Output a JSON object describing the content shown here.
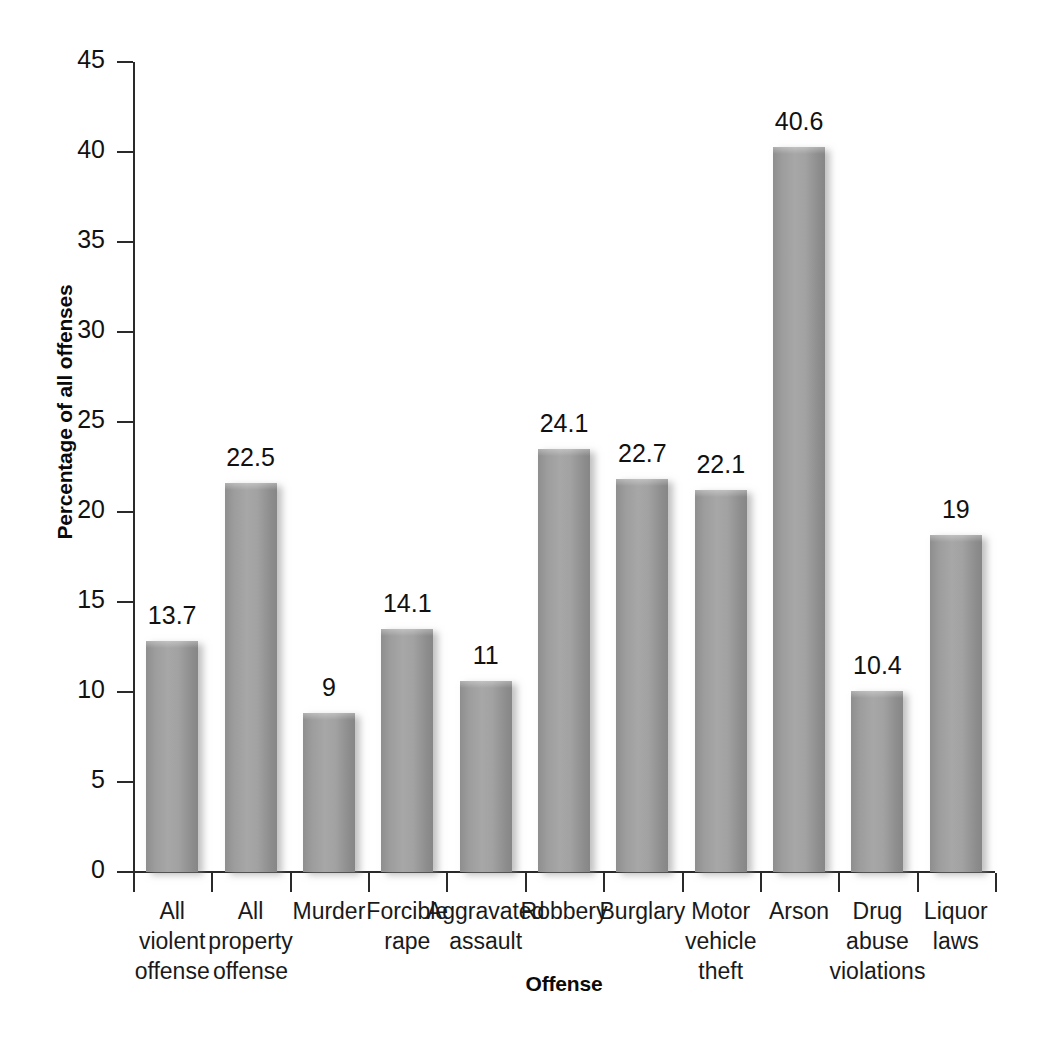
{
  "chart_data": {
    "type": "bar",
    "title": "",
    "xlabel": "Offense",
    "ylabel": "Percentage of all offenses",
    "ylim": [
      0,
      45
    ],
    "ytick_step": 5,
    "yticks": [
      "0",
      "5",
      "10",
      "15",
      "20",
      "25",
      "30",
      "35",
      "40",
      "45"
    ],
    "grid": false,
    "legend": "none",
    "bar_color": "#9b9b9b",
    "axis_color": "#2a2a2a",
    "categories": [
      "All violent offense",
      "All property offense",
      "Murder",
      "Forcible rape",
      "Aggravated assault",
      "Robbery",
      "Burglary",
      "Motor vehicle theft",
      "Arson",
      "Drug abuse violations",
      "Liquor laws"
    ],
    "category_lines": [
      [
        "All",
        "violent",
        "offense"
      ],
      [
        "All",
        "property",
        "offense"
      ],
      [
        "Murder"
      ],
      [
        "Forcible",
        "rape"
      ],
      [
        "Aggravated",
        "assault"
      ],
      [
        "Robbery"
      ],
      [
        "Burglary"
      ],
      [
        "Motor",
        "vehicle",
        "theft"
      ],
      [
        "Arson"
      ],
      [
        "Drug",
        "abuse",
        "violations"
      ],
      [
        "Liquor",
        "laws"
      ]
    ],
    "values": [
      13.7,
      22.5,
      9,
      14.1,
      11,
      24.1,
      22.7,
      22.1,
      40.6,
      10.4,
      19
    ],
    "value_labels": [
      "13.7",
      "22.5",
      "9",
      "14.1",
      "11",
      "24.1",
      "22.7",
      "22.1",
      "40.6",
      "10.4",
      "19"
    ],
    "bar_tops_value": [
      12.85,
      21.6,
      8.85,
      13.5,
      10.6,
      23.5,
      21.85,
      21.2,
      40.3,
      10.05,
      18.7
    ]
  }
}
